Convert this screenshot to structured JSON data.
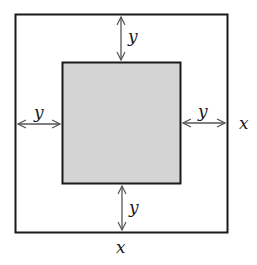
{
  "diagram": {
    "outer_square": {
      "side_label": "x",
      "stroke": "#1a1a1a",
      "fill": "#ffffff"
    },
    "inner_square": {
      "fill": "#d4d4d4",
      "stroke": "#1a1a1a"
    },
    "gap_label": "y",
    "labels": {
      "top_gap": "y",
      "left_gap": "y",
      "right_gap": "y",
      "bottom_gap": "y",
      "right_side": "x",
      "bottom_side": "x"
    },
    "arrow_color": "#555555"
  }
}
